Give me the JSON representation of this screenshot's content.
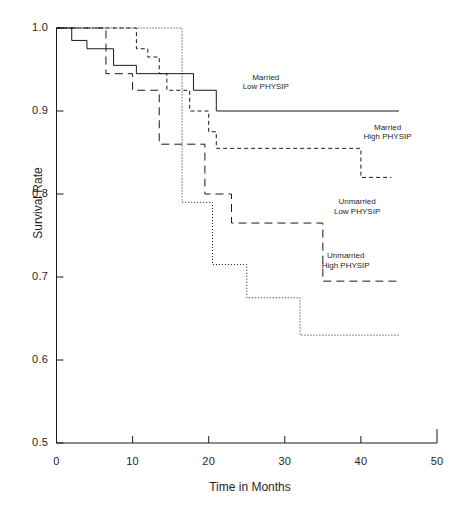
{
  "chart_data": {
    "type": "line",
    "title": "",
    "subtitle": "",
    "xlabel": "Time in Months",
    "ylabel": "Survival Rate",
    "xlim": [
      0,
      50
    ],
    "ylim": [
      0.5,
      1.0
    ],
    "xticks": [
      0,
      10,
      20,
      30,
      40,
      50
    ],
    "xtick_labels": [
      "0",
      "10",
      "20",
      "30",
      "40",
      "50"
    ],
    "yticks": [
      0.5,
      0.6,
      0.7,
      0.8,
      0.9,
      1.0
    ],
    "ytick_labels": [
      "0.5",
      "0.6",
      "0.7",
      "0.8",
      "0.9",
      "1.0"
    ],
    "grid": false,
    "legend_position": "inline-annotations",
    "line_color": "#1a1a1a",
    "series": [
      {
        "name": "Married Low PHYSIP",
        "label_line1": "Married",
        "label_line2": "Low PHYSIP",
        "style": "solid",
        "dash": "none",
        "x": [
          0,
          2.0,
          2.0,
          4.0,
          4.0,
          7.5,
          7.5,
          10.5,
          10.5,
          18.0,
          18.0,
          21.0,
          21.0,
          45.0
        ],
        "y": [
          1.0,
          1.0,
          0.985,
          0.985,
          0.975,
          0.975,
          0.955,
          0.955,
          0.945,
          0.945,
          0.925,
          0.925,
          0.9,
          0.9
        ],
        "steps": [
          {
            "time": 0,
            "survival": 1.0
          },
          {
            "time": 2.0,
            "survival": 0.985
          },
          {
            "time": 4.0,
            "survival": 0.975
          },
          {
            "time": 7.5,
            "survival": 0.955
          },
          {
            "time": 10.5,
            "survival": 0.945
          },
          {
            "time": 18.0,
            "survival": 0.925
          },
          {
            "time": 21.0,
            "survival": 0.9
          },
          {
            "time": 45.0,
            "survival": 0.9
          }
        ]
      },
      {
        "name": "Married High PHYSIP",
        "label_line1": "Married",
        "label_line2": "High PHYSIP",
        "style": "short-dash",
        "dash": "4,3",
        "x": [
          0,
          10.5,
          10.5,
          12.0,
          12.0,
          13.5,
          13.5,
          14.5,
          14.5,
          17.5,
          17.5,
          20.0,
          20.0,
          21.0,
          21.0,
          40.0,
          40.0,
          44.0
        ],
        "y": [
          1.0,
          1.0,
          0.975,
          0.975,
          0.965,
          0.965,
          0.945,
          0.945,
          0.925,
          0.925,
          0.9,
          0.9,
          0.875,
          0.875,
          0.855,
          0.855,
          0.82,
          0.82
        ],
        "steps": [
          {
            "time": 0,
            "survival": 1.0
          },
          {
            "time": 10.5,
            "survival": 0.975
          },
          {
            "time": 12.0,
            "survival": 0.965
          },
          {
            "time": 13.5,
            "survival": 0.945
          },
          {
            "time": 14.5,
            "survival": 0.925
          },
          {
            "time": 17.5,
            "survival": 0.9
          },
          {
            "time": 20.0,
            "survival": 0.875
          },
          {
            "time": 21.0,
            "survival": 0.855
          },
          {
            "time": 40.0,
            "survival": 0.82
          },
          {
            "time": 44.0,
            "survival": 0.82
          }
        ]
      },
      {
        "name": "Unmarried Low PHYSIP",
        "label_line1": "Unmarried",
        "label_line2": "Low PHYSIP",
        "style": "dotted",
        "dash": "1,2",
        "x": [
          0,
          16.5,
          16.5,
          20.5,
          20.5,
          25.0,
          25.0,
          32.0,
          32.0,
          45.0
        ],
        "y": [
          1.0,
          1.0,
          0.79,
          0.79,
          0.715,
          0.715,
          0.675,
          0.675,
          0.63,
          0.63
        ],
        "steps": [
          {
            "time": 0,
            "survival": 1.0
          },
          {
            "time": 16.5,
            "survival": 0.79
          },
          {
            "time": 20.5,
            "survival": 0.715
          },
          {
            "time": 25.0,
            "survival": 0.675
          },
          {
            "time": 32.0,
            "survival": 0.63
          },
          {
            "time": 45.0,
            "survival": 0.63
          }
        ]
      },
      {
        "name": "Unmarried High PHYSIP",
        "label_line1": "Unmarried",
        "label_line2": "High PHYSIP",
        "style": "long-dash",
        "dash": "8,5",
        "x": [
          0,
          6.5,
          6.5,
          10.0,
          10.0,
          13.5,
          13.5,
          19.5,
          19.5,
          23.0,
          23.0,
          35.0,
          35.0,
          45.0
        ],
        "y": [
          1.0,
          1.0,
          0.945,
          0.945,
          0.925,
          0.925,
          0.86,
          0.86,
          0.8,
          0.8,
          0.765,
          0.765,
          0.695,
          0.695
        ],
        "steps": [
          {
            "time": 0,
            "survival": 1.0
          },
          {
            "time": 6.5,
            "survival": 0.945
          },
          {
            "time": 10.0,
            "survival": 0.925
          },
          {
            "time": 13.5,
            "survival": 0.86
          },
          {
            "time": 19.5,
            "survival": 0.8
          },
          {
            "time": 23.0,
            "survival": 0.765
          },
          {
            "time": 35.0,
            "survival": 0.695
          },
          {
            "time": 45.0,
            "survival": 0.695
          }
        ]
      }
    ],
    "annotations": [
      {
        "text": "Married Low PHYSIP",
        "x": 27.5,
        "y": 0.935
      },
      {
        "text": "Married High PHYSIP",
        "x": 43.5,
        "y": 0.875
      },
      {
        "text": "Unmarried Low PHYSIP",
        "x": 39.5,
        "y": 0.785
      },
      {
        "text": "Unmarried High PHYSIP",
        "x": 38.0,
        "y": 0.72
      }
    ]
  },
  "axes": {
    "y_title": "Survival Rate",
    "x_title": "Time in Months"
  }
}
